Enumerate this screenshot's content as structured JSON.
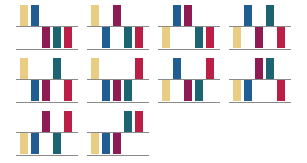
{
  "figure": {
    "type": "small-multiples-bar-grid",
    "panel_count": 10,
    "columns": 4,
    "rows": 3,
    "bars_per_panel": 5,
    "background_color": "#ffffff",
    "axis_color": "#8a8a8a"
  },
  "series": [
    {
      "key": "yellow",
      "name": "Series 1",
      "color": "#e8cd82"
    },
    {
      "key": "blue",
      "name": "Series 2",
      "color": "#1f5d92"
    },
    {
      "key": "purple",
      "name": "Series 3",
      "color": "#8e1b54"
    },
    {
      "key": "teal",
      "name": "Series 4",
      "color": "#1d6472"
    },
    {
      "key": "crimson",
      "name": "Series 5",
      "color": "#bb1f45"
    }
  ],
  "chart_data": {
    "type": "bar",
    "title": "",
    "subtitle": "",
    "xlabel": "",
    "ylabel": "",
    "ylim": [
      -1,
      1
    ],
    "grid": false,
    "legend": "none",
    "categories": [
      "Series 1",
      "Series 2",
      "Series 3",
      "Series 4",
      "Series 5"
    ],
    "category_colors": [
      "#e8cd82",
      "#1f5d92",
      "#8e1b54",
      "#1d6472",
      "#bb1f45"
    ],
    "panels": [
      {
        "index": 1,
        "values": [
          1,
          1,
          -1,
          -1,
          -1
        ]
      },
      {
        "index": 2,
        "values": [
          1,
          -1,
          1,
          -1,
          -1
        ]
      },
      {
        "index": 3,
        "values": [
          -1,
          1,
          1,
          -1,
          -1
        ]
      },
      {
        "index": 4,
        "values": [
          -1,
          1,
          -1,
          1,
          -1
        ]
      },
      {
        "index": 5,
        "values": [
          1,
          -1,
          -1,
          1,
          -1
        ]
      },
      {
        "index": 6,
        "values": [
          1,
          -1,
          -1,
          -1,
          1
        ]
      },
      {
        "index": 7,
        "values": [
          -1,
          1,
          -1,
          -1,
          1
        ]
      },
      {
        "index": 8,
        "values": [
          -1,
          -1,
          1,
          1,
          -1
        ]
      },
      {
        "index": 9,
        "values": [
          -1,
          -1,
          1,
          -1,
          1
        ]
      },
      {
        "index": 10,
        "values": [
          -1,
          -1,
          -1,
          1,
          1
        ]
      }
    ]
  }
}
